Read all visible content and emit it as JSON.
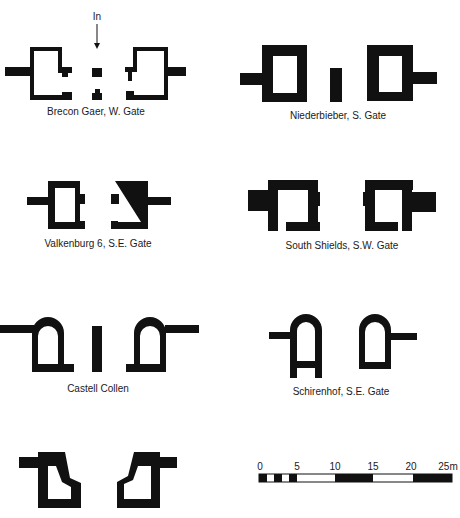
{
  "figure": {
    "type": "comparative plans of Roman fort gateways",
    "entrance_marker": {
      "label": "In",
      "icon": "arrow-down-icon"
    },
    "gates": [
      {
        "id": "brecon-gaer",
        "label": "Brecon Gaer, W. Gate"
      },
      {
        "id": "niederbieber",
        "label": "Niederbieber, S. Gate"
      },
      {
        "id": "valkenburg",
        "label": "Valkenburg 6, S.E. Gate"
      },
      {
        "id": "south-shields",
        "label": "South Shields, S.W. Gate"
      },
      {
        "id": "castell-collen",
        "label": "Castell Collen"
      },
      {
        "id": "schirenhof",
        "label": "Schirenhof, S.E. Gate"
      },
      {
        "id": "unlabeled-gate",
        "label": ""
      }
    ],
    "scale_bar": {
      "unit": "m",
      "ticks": [
        "0",
        "5",
        "10",
        "15",
        "20",
        "25m"
      ],
      "max": 25
    }
  },
  "colors": {
    "ink": "#111111",
    "background": "#ffffff"
  }
}
